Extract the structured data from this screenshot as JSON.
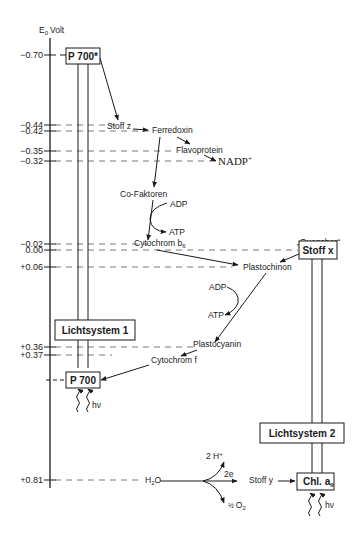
{
  "axis": {
    "label": "E",
    "label_sub": "0",
    "label_sup": "'",
    "label_unit": "Volt",
    "ticks": [
      {
        "label": "−0.70",
        "y": 55
      },
      {
        "label": "−0.44",
        "y": 125
      },
      {
        "label": "−0.42",
        "y": 131
      },
      {
        "label": "−0.35",
        "y": 151
      },
      {
        "label": "−0.32",
        "y": 161
      },
      {
        "label": "−0.02",
        "y": 244
      },
      {
        "label": "0.00",
        "y": 250
      },
      {
        "label": "+0.06",
        "y": 267
      },
      {
        "label": "+0.36",
        "y": 347
      },
      {
        "label": "+0.37",
        "y": 355
      },
      {
        "label": "+0.81",
        "y": 480
      }
    ]
  },
  "photosystem1": {
    "p700_star": "P 700*",
    "label": "Lichtsystem 1",
    "p700": "P 700",
    "light": "hν"
  },
  "photosystem2": {
    "quencher": "„Quencher“",
    "stoff_x": "Stoff x",
    "label": "Lichtsystem 2",
    "chl_main": "Chl. a",
    "chl_sub": "II",
    "light": "hν"
  },
  "carriers": {
    "stoff_z": "Stoff z",
    "ferredoxin": "Ferredoxin",
    "flavoprotein": "Flavoprotein",
    "nadp": "NADP",
    "nadp_sup": "+",
    "cofaktoren": "Co-Faktoren",
    "adp_1": "ADP",
    "atp_1": "ATP",
    "cytochrom_b6": "Cytochrom b",
    "cytochrom_b6_sub": "6",
    "plastochinon": "Plastochinon",
    "adp_2": "ADP",
    "atp_2": "ATP",
    "plastocyanin": "Plastocyanin",
    "cytochrom_f": "Cytochrom f",
    "stoff_y": "Stoff y"
  },
  "water_split": {
    "h2o": "H",
    "h2o_sub": "2",
    "h2o_end": "O",
    "protons": "2 H",
    "protons_sup": "+",
    "electrons": "2e",
    "oxygen_frac": "½",
    "oxygen": "O",
    "oxygen_sub": "2"
  }
}
